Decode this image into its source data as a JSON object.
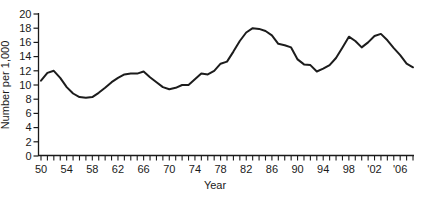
{
  "chart_data": {
    "type": "line",
    "title": "",
    "xlabel": "Year",
    "ylabel": "Number per 1,000",
    "ylim": [
      0,
      20
    ],
    "y_tick_step": 2,
    "y_tick_labels": [
      "0",
      "2",
      "4",
      "6",
      "8",
      "10",
      "12",
      "14",
      "16",
      "18",
      "20"
    ],
    "x_range": [
      1950,
      2008
    ],
    "x_minor_tick_every_years": 1,
    "x_label_ticks": [
      {
        "year": 1950,
        "label": "50"
      },
      {
        "year": 1954,
        "label": "54"
      },
      {
        "year": 1958,
        "label": "58"
      },
      {
        "year": 1962,
        "label": "62"
      },
      {
        "year": 1966,
        "label": "66"
      },
      {
        "year": 1970,
        "label": "70"
      },
      {
        "year": 1974,
        "label": "74"
      },
      {
        "year": 1978,
        "label": "78"
      },
      {
        "year": 1982,
        "label": "82"
      },
      {
        "year": 1986,
        "label": "86"
      },
      {
        "year": 1990,
        "label": "90"
      },
      {
        "year": 1994,
        "label": "94"
      },
      {
        "year": 1998,
        "label": "98"
      },
      {
        "year": 2002,
        "label": "'02"
      },
      {
        "year": 2006,
        "label": "'06"
      }
    ],
    "grid": false,
    "legend_position": "none",
    "line_color": "#1c1c1c",
    "axis_color": "#1a1a1a",
    "series": [
      {
        "name": "Number per 1,000",
        "x_start_year": 1950,
        "values": [
          10.6,
          11.7,
          12.0,
          11.0,
          9.7,
          8.8,
          8.3,
          8.2,
          8.3,
          8.9,
          9.6,
          10.4,
          11.0,
          11.5,
          11.6,
          11.6,
          11.9,
          11.1,
          10.4,
          9.7,
          9.4,
          9.6,
          10.0,
          10.0,
          10.8,
          11.6,
          11.5,
          12.0,
          13.0,
          13.3,
          14.7,
          16.2,
          17.4,
          18.0,
          17.9,
          17.6,
          17.0,
          15.8,
          15.6,
          15.3,
          13.6,
          12.9,
          12.8,
          11.9,
          12.3,
          12.8,
          13.8,
          15.3,
          16.8,
          16.2,
          15.3,
          16.0,
          16.9,
          17.2,
          16.3,
          15.2,
          14.2,
          13.0,
          12.5
        ]
      }
    ]
  }
}
